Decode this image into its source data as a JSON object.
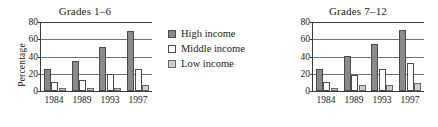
{
  "figure": {
    "background": "#ffffff",
    "bar_colors": {
      "high_income": "#8a8a8a",
      "middle_income": "#ffffff",
      "low_income": "#cdcdcd",
      "outline": "#4a4a4a"
    }
  },
  "legend": {
    "position": "center",
    "entries": [
      {
        "key": "high",
        "label": "High income",
        "swatch": "dark-gray-swatch-icon"
      },
      {
        "key": "middle",
        "label": "Middle income",
        "swatch": "white-swatch-icon"
      },
      {
        "key": "low",
        "label": "Low income",
        "swatch": "light-gray-swatch-icon"
      }
    ]
  },
  "chart_data": [
    {
      "type": "bar",
      "title": "Grades 1–6",
      "xlabel": "",
      "ylabel": "Percentage",
      "categories": [
        "1984",
        "1989",
        "1993",
        "1997"
      ],
      "yticks": [
        0,
        20,
        40,
        60,
        80
      ],
      "ylim": [
        0,
        80
      ],
      "grid": true,
      "legend_position": "center",
      "series": [
        {
          "name": "High income",
          "values": [
            25,
            35,
            51,
            70
          ]
        },
        {
          "name": "Middle income",
          "values": [
            10,
            13,
            20,
            26
          ]
        },
        {
          "name": "Low income",
          "values": [
            3,
            3,
            3,
            7
          ]
        }
      ]
    },
    {
      "type": "bar",
      "title": "Grades 7–12",
      "xlabel": "",
      "ylabel": "",
      "categories": [
        "1984",
        "1989",
        "1993",
        "1997"
      ],
      "yticks": [
        0,
        20,
        40,
        60,
        80
      ],
      "ylim": [
        0,
        80
      ],
      "grid": true,
      "legend_position": "center",
      "series": [
        {
          "name": "High income",
          "values": [
            26,
            41,
            55,
            71
          ]
        },
        {
          "name": "Middle income",
          "values": [
            11,
            18,
            25,
            33
          ]
        },
        {
          "name": "Low income",
          "values": [
            4,
            7,
            7,
            9
          ]
        }
      ]
    }
  ]
}
